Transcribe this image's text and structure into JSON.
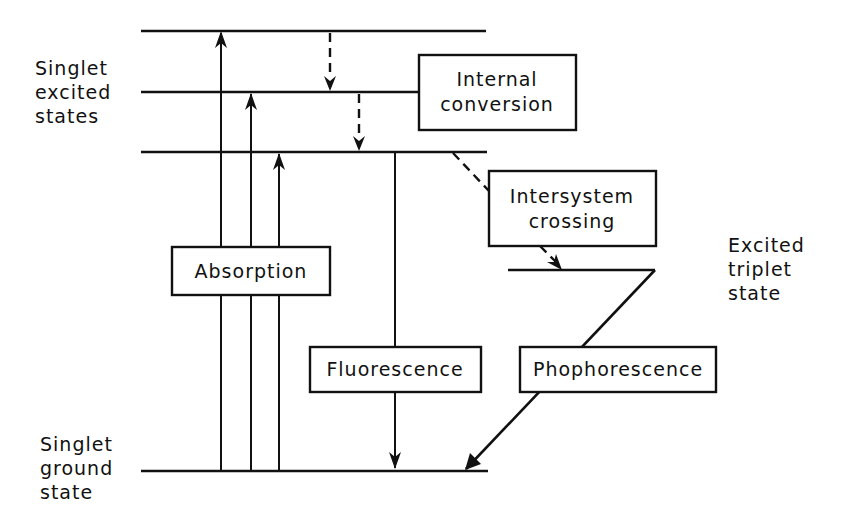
{
  "diagram": {
    "state_labels": {
      "singlet_excited": [
        "Singlet",
        "excited",
        "states"
      ],
      "singlet_ground": [
        "Singlet",
        "ground",
        "state"
      ],
      "triplet_excited": [
        "Excited",
        "triplet",
        "state"
      ]
    },
    "process_boxes": {
      "internal_conversion": [
        "Internal",
        "conversion"
      ],
      "intersystem_crossing": [
        "Intersystem",
        "crossing"
      ],
      "absorption": "Absorption",
      "fluorescence": "Fluorescence",
      "phosphorescence": "Phophorescence"
    },
    "colors": {
      "ink": "#111111",
      "background": "#ffffff"
    }
  }
}
